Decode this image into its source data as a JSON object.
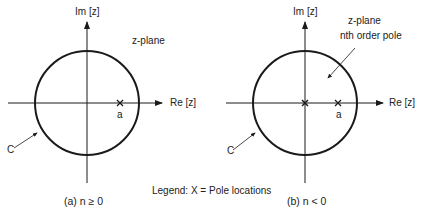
{
  "diagram": {
    "legend": "Legend: X = Pole locations",
    "panels": [
      {
        "id": "a",
        "caption": "(a) n ≥ 0",
        "imag_axis_label": "Im [z]",
        "real_axis_label": "Re [z]",
        "plane_label": "z-plane",
        "contour_label": "C",
        "pole_label": "a",
        "poles": [
          "a"
        ]
      },
      {
        "id": "b",
        "caption": "(b) n < 0",
        "imag_axis_label": "Im [z]",
        "real_axis_label": "Re [z]",
        "plane_label": "z-plane",
        "annotation": "nth order pole",
        "contour_label": "C",
        "pole_label": "a",
        "poles": [
          "origin (nth order)",
          "a"
        ]
      }
    ]
  },
  "colors": {
    "ink": "#1a1a1a",
    "background": "#ffffff"
  }
}
